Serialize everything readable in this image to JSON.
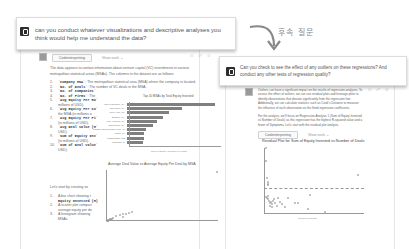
{
  "left_chat": {
    "user_prompt": "can you conduct whatever visualizations and descriptive analyses you think would help me understand the data?",
    "response_tabs": [
      {
        "label": "Codeinterpreting"
      },
      {
        "label": "Show work ⌄"
      }
    ],
    "message_actions": "⊡ ☍ ⊘",
    "intro": "The data appears to contain information about venture capital (VC) investments in various metropolitan statistical areas (MSAs). The columns in the dataset are as follows:",
    "columns": [
      {
        "num": "1.",
        "name": "`Company MSA`",
        "desc": ": The metropolitan statistical area (MSA) where the company is located."
      },
      {
        "num": "2.",
        "name": "`No. of Deals`",
        "desc": ": The number of VC deals in the MSA."
      },
      {
        "num": "3.",
        "name": "`No. of Companies`",
        "desc": ""
      },
      {
        "num": "4.",
        "name": "`No. of Firms`",
        "desc": ": The"
      },
      {
        "num": "5.",
        "name": "`Avg Equity Per Ro`",
        "desc": ""
      },
      {
        "num": "",
        "name": "",
        "desc": "millions of USD)."
      },
      {
        "num": "6.",
        "name": "`Avg Equity Per Co`",
        "desc": ""
      },
      {
        "num": "",
        "name": "",
        "desc": "the MSA (in millions o"
      },
      {
        "num": "7.",
        "name": "`Avg Equity Per Fi`",
        "desc": ""
      },
      {
        "num": "",
        "name": "",
        "desc": "(in millions of USD)."
      },
      {
        "num": "8.",
        "name": "`Avg Deal Value (M`",
        "desc": ""
      },
      {
        "num": "",
        "name": "",
        "desc": "USD)."
      },
      {
        "num": "9.",
        "name": "`Sum of Equity Inv`",
        "desc": ""
      },
      {
        "num": "",
        "name": "",
        "desc": "(in millions of USD)."
      },
      {
        "num": "10.",
        "name": "`Sum of Deal Value`",
        "desc": ""
      },
      {
        "num": "",
        "name": "",
        "desc": "USD)."
      }
    ],
    "plan_intro": "Let's start by creating so",
    "plan": [
      {
        "num": "1.",
        "text": "A bar chart showing t"
      },
      {
        "num": "",
        "text": "Equity Invested (M)"
      },
      {
        "num": "2.",
        "text": "A scatter plot compari"
      },
      {
        "num": "",
        "text": "average equity per de"
      },
      {
        "num": "3.",
        "text": "A histogram showing"
      },
      {
        "num": "",
        "text": "MSAs."
      }
    ]
  },
  "chart_data": [
    {
      "type": "bar",
      "title": "Top 10 MSAs by Total Equity Invested",
      "orientation": "horizontal",
      "categories": [
        "San Francisco, CA",
        "San Jose, CA",
        "New York, NY",
        "Boston, MA",
        "Los Angeles, CA",
        "San Diego, CA",
        "Seattle-Tacoma-Bellevue, WA",
        "Austin, TX",
        "Washington, DC",
        "Chicago, IL"
      ],
      "values": [
        7800,
        4900,
        3700,
        3200,
        2700,
        2300,
        1700,
        1500,
        1500,
        1400
      ],
      "xlabel": "Sum of Equity Invested (M USD)",
      "ylabel": "MSA",
      "xticks": [
        "0",
        "1000",
        "2000",
        "3000",
        "4000",
        "5000",
        "6000",
        "7000",
        "8000"
      ],
      "xlim": [
        0,
        8000
      ],
      "grid": false
    },
    {
      "type": "scatter",
      "title": "Average Deal Value vs Average Equity Per Deal by MSA",
      "xlabel": "Average Deal Value (M USD)",
      "ylabel": "Average Equity Per Deal (M USD)",
      "xticks": [
        "0",
        "250",
        "500",
        "750",
        "1000",
        "1250",
        "1500",
        "1750"
      ],
      "yticks": [
        "0",
        "250",
        "500",
        "750",
        "1000",
        "1250",
        "1500",
        "1750"
      ],
      "xlim": [
        0,
        1750
      ],
      "ylim": [
        0,
        1800
      ],
      "points": [
        [
          5,
          5
        ],
        [
          10,
          12
        ],
        [
          15,
          18
        ],
        [
          20,
          22
        ],
        [
          30,
          35
        ],
        [
          40,
          45
        ],
        [
          50,
          55
        ],
        [
          60,
          70
        ],
        [
          80,
          90
        ],
        [
          100,
          110
        ],
        [
          150,
          170
        ],
        [
          200,
          230
        ],
        [
          250,
          260
        ],
        [
          300,
          270
        ],
        [
          350,
          280
        ],
        [
          400,
          320
        ],
        [
          250,
          150
        ],
        [
          1750,
          1750
        ]
      ],
      "grid": false
    },
    {
      "type": "scatter",
      "title": "Residual Plot for Sum of Equity Invested vs Number of Deals",
      "xlabel": "Number of Deals",
      "ylabel": "Residuals (Equity Invested)",
      "xticks": [
        "0",
        "200",
        "400",
        "600",
        "800",
        "1000",
        "1200",
        "1400"
      ],
      "yticks": [
        "-1000",
        "0",
        "1000",
        "2000",
        "3000",
        "4000"
      ],
      "xlim": [
        0,
        1500
      ],
      "ylim": [
        -1200,
        4200
      ],
      "zero_line": true,
      "points": [
        [
          10,
          4300
        ],
        [
          20,
          3200
        ],
        [
          30,
          1800
        ],
        [
          40,
          1500
        ],
        [
          45,
          1300
        ],
        [
          50,
          1200
        ],
        [
          20,
          200
        ],
        [
          30,
          100
        ],
        [
          40,
          300
        ],
        [
          50,
          50
        ],
        [
          60,
          -100
        ],
        [
          70,
          -300
        ],
        [
          80,
          -500
        ],
        [
          90,
          -200
        ],
        [
          100,
          -400
        ],
        [
          110,
          -600
        ],
        [
          120,
          -100
        ],
        [
          130,
          50
        ],
        [
          150,
          -300
        ],
        [
          180,
          -500
        ],
        [
          200,
          100
        ],
        [
          220,
          -200
        ],
        [
          250,
          -400
        ],
        [
          300,
          -650
        ],
        [
          350,
          100
        ],
        [
          450,
          -250
        ],
        [
          500,
          -300
        ],
        [
          650,
          -800
        ],
        [
          680,
          350
        ],
        [
          900,
          -1000
        ],
        [
          1400,
          2000
        ]
      ],
      "grid": false
    }
  ],
  "annotation": {
    "followup_label": "후속 질문"
  },
  "right_chat": {
    "user_prompt": "Can you check to see the effect of any outliers on these regressions? And conduct any other tests of regression quality?",
    "message_actions": "⊡ ☍ ⊘",
    "para1": "Outliers can have a significant impact on the results of regression analyses. To assess the effect of outliers, we can use residual plots and leverage plots to identify observations that deviate significantly from the regression line. Additionally, we can calculate statistics such as Cook's Distance to measure the influence of each observation on the fitted regression coefficients.",
    "para2": "For the analysis, we'll focus on Regression Analysis 1 (Sum of Equity Invested vs Number of Deals) as this regression has the highest R-squared value and a fewer of Symptoms. Let's start with the residual plot analysis.",
    "response_tabs": [
      {
        "label": "Codeinterpreting"
      },
      {
        "label": "Show work ⌄"
      }
    ]
  }
}
